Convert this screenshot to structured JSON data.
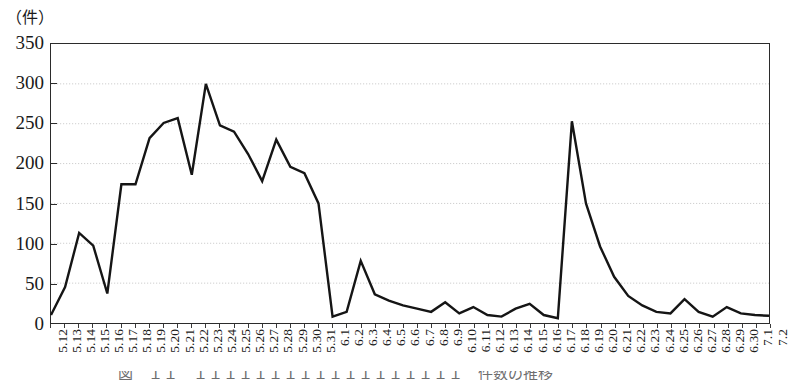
{
  "chart_data": {
    "type": "line",
    "title": "",
    "subtitle": "",
    "unit_label": "（件）",
    "xlabel": "",
    "ylabel": "",
    "ylim": [
      0,
      350
    ],
    "yticks": [
      0,
      50,
      100,
      150,
      200,
      250,
      300,
      350
    ],
    "grid": "horizontal-dotted",
    "legend": "none",
    "series_name": "件数",
    "line_color": "#151515",
    "grid_color": "#c9c9c9",
    "axis_color": "#2b2b2b",
    "background_color": "#ffffff",
    "categories": [
      "5.12",
      "5.13",
      "5.14",
      "5.15",
      "5.16",
      "5.17",
      "5.18",
      "5.19",
      "5.20",
      "5.21",
      "5.22",
      "5.23",
      "5.24",
      "5.25",
      "5.26",
      "5.27",
      "5.28",
      "5.29",
      "5.30",
      "5.31",
      "6.1",
      "6.2",
      "6.3",
      "6.4",
      "6.5",
      "6.6",
      "6.7",
      "6.8",
      "6.9",
      "6.10",
      "6.11",
      "6.12",
      "6.13",
      "6.14",
      "6.15",
      "6.16",
      "6.17",
      "6.18",
      "6.19",
      "6.20",
      "6.21",
      "6.22",
      "6.23",
      "6.24",
      "6.25",
      "6.26",
      "6.27",
      "6.28",
      "6.29",
      "6.30",
      "7.1",
      "7.2"
    ],
    "values": [
      10,
      45,
      113,
      97,
      37,
      174,
      174,
      232,
      251,
      257,
      186,
      300,
      248,
      240,
      212,
      178,
      230,
      196,
      188,
      150,
      8,
      14,
      78,
      36,
      28,
      22,
      18,
      14,
      26,
      12,
      20,
      10,
      8,
      18,
      24,
      10,
      6,
      253,
      150,
      96,
      58,
      34,
      22,
      14,
      12,
      30,
      14,
      8,
      20,
      12,
      10,
      9
    ],
    "annotations": []
  },
  "caption": {
    "text": "図　１１　１１１１１１１１１１１１１１１１１１　件数の推移",
    "visible_fragment": true
  }
}
